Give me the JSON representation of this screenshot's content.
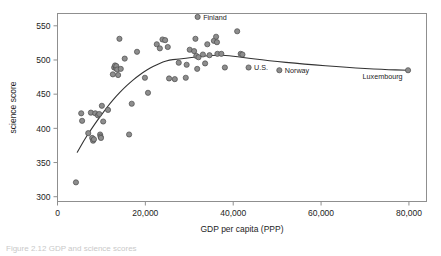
{
  "figure": {
    "caption": "Figure 2.12   GDP and science scores",
    "plot_bg": "#ffffff",
    "frame_color": "#8f8f8f",
    "marker_fill": "#8d8d8d",
    "marker_stroke": "#4a4a4a",
    "curve_color": "#333333"
  },
  "chart_data": {
    "type": "scatter",
    "title": "",
    "xlabel": "GDP per capita (PPP)",
    "ylabel": "science score",
    "xlim": [
      0,
      84000
    ],
    "ylim": [
      293,
      568
    ],
    "grid": false,
    "legend": "none",
    "xticks": [
      0,
      20000,
      40000,
      60000,
      80000
    ],
    "xticklabels": [
      "0",
      "20,000",
      "40,000",
      "60,000",
      "80,000"
    ],
    "yticks": [
      300,
      350,
      400,
      450,
      500,
      550
    ],
    "yticklabels": [
      "300",
      "350",
      "400",
      "450",
      "500",
      "550"
    ],
    "series": [
      {
        "name": "countries",
        "x": [
          4200,
          5400,
          5600,
          7000,
          7600,
          7900,
          8100,
          8300,
          8600,
          9200,
          9500,
          9700,
          9800,
          9900,
          10100,
          10400,
          11500,
          12600,
          12900,
          13100,
          13300,
          13400,
          13600,
          13800,
          14100,
          14400,
          15300,
          16300,
          16900,
          18100,
          19900,
          20600,
          22600,
          23300,
          23900,
          24500,
          25100,
          25400,
          26700,
          27600,
          29200,
          29400,
          30100,
          31100,
          31400,
          31600,
          31800,
          32100,
          33100,
          33600,
          34100,
          34600,
          35600,
          36100,
          36300,
          36400,
          37300,
          38100,
          40900,
          41700,
          42100,
          31900,
          43500,
          50500,
          79800
        ],
        "y": [
          321,
          422,
          411,
          393,
          423,
          386,
          382,
          384,
          422,
          419,
          421,
          391,
          388,
          386,
          433,
          410,
          427,
          479,
          489,
          492,
          488,
          491,
          486,
          478,
          531,
          487,
          502,
          391,
          436,
          512,
          474,
          452,
          523,
          517,
          530,
          529,
          519,
          473,
          472,
          496,
          474,
          493,
          515,
          513,
          531,
          506,
          487,
          504,
          508,
          495,
          523,
          507,
          528,
          534,
          526,
          509,
          509,
          489,
          542,
          509,
          508,
          563,
          489,
          485,
          485
        ]
      }
    ],
    "trend_curve": {
      "name": "loess-smoother",
      "x": [
        4500,
        6000,
        7500,
        9000,
        10500,
        12000,
        13500,
        15000,
        16500,
        18000,
        19500,
        21000,
        22500,
        24000,
        25500,
        27000,
        28500,
        30000,
        32000,
        34000,
        36000,
        38000,
        42000,
        48000,
        56000,
        66000,
        74000,
        79800
      ],
      "y": [
        365,
        382,
        397,
        411,
        424,
        437,
        448,
        458,
        467,
        475,
        482,
        488,
        493,
        497,
        500,
        501,
        502,
        503,
        505,
        506,
        507,
        507,
        504,
        499,
        494,
        489,
        486,
        485
      ]
    },
    "annotations": [
      {
        "label": "Finland",
        "x": 31900,
        "y": 563,
        "side": "right"
      },
      {
        "label": "U.S.",
        "x": 43500,
        "y": 489,
        "side": "right"
      },
      {
        "label": "Norway",
        "x": 50500,
        "y": 485,
        "side": "right"
      },
      {
        "label": "Luxembourg",
        "x": 79800,
        "y": 485,
        "side": "left"
      }
    ]
  }
}
